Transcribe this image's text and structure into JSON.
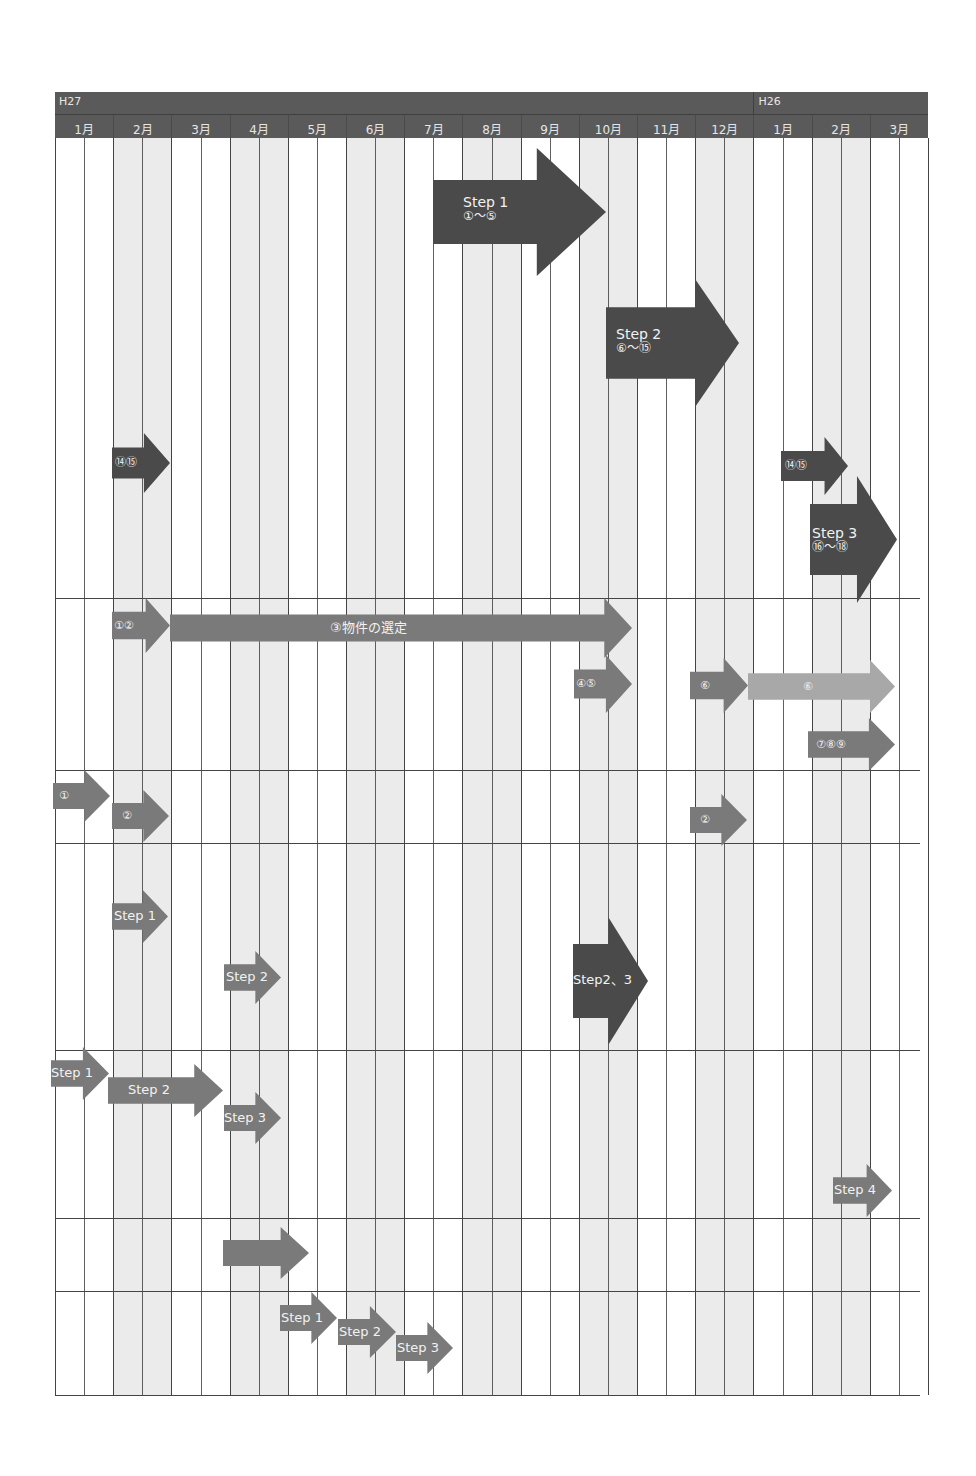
{
  "header": {
    "years": [
      {
        "label": "H27",
        "start_month_index": 0,
        "span": 12
      },
      {
        "label": "H26",
        "start_month_index": 12,
        "span": 3
      }
    ],
    "months": [
      "1月",
      "2月",
      "3月・4月",
      "4月",
      "5月",
      "6月",
      "7月",
      "8月",
      "9月",
      "10月",
      "11月",
      "12月",
      "1月",
      "2月",
      "3月"
    ],
    "month_labels_display": [
      "1月",
      "2月",
      "3月",
      "4月",
      "5月",
      "6月",
      "7月",
      "8月",
      "9月",
      "10月",
      "11月",
      "12月",
      "1月",
      "2月",
      "3月"
    ]
  },
  "colors": {
    "header_bg": "#5a5a5a",
    "header_text": "#e6e6e6",
    "shaded_column": "#ebebeb",
    "grid_line": "#444444",
    "arrow_dark": "#4a4a4a",
    "arrow_medium": "#7a7a7a",
    "arrow_light": "#a8a8a8",
    "arrow_text": "#f2f2f2"
  },
  "chart_data": {
    "type": "table",
    "title": "",
    "axis": {
      "x_categories": [
        "H27 1月",
        "2月",
        "3月",
        "4月",
        "5月",
        "6月",
        "7月",
        "8月",
        "9月",
        "10月",
        "11月",
        "12月",
        "H26 1月",
        "2月",
        "3月"
      ],
      "grid": true
    },
    "rows": [
      {
        "row": 1,
        "bars": [
          {
            "label": "Step 1",
            "sublabel": "①〜⑤",
            "start": 6.8,
            "end": 9.6,
            "shade": "dark",
            "size": "large"
          },
          {
            "label": "Step 2",
            "sublabel": "⑥〜⑮",
            "start": 9.6,
            "end": 11.9,
            "shade": "dark",
            "size": "large"
          },
          {
            "label": "⑭⑮",
            "start": 1.0,
            "end": 2.0,
            "shade": "dark"
          },
          {
            "label": "⑭⑮",
            "start": 12.5,
            "end": 13.5,
            "shade": "dark"
          },
          {
            "label": "Step 3",
            "sublabel": "⑯〜⑱",
            "start": 13.0,
            "end": 14.5,
            "shade": "dark",
            "size": "large"
          }
        ]
      },
      {
        "row": 2,
        "bars": [
          {
            "label": "①②",
            "start": 1.0,
            "end": 2.0,
            "shade": "medium"
          },
          {
            "label": "③物件の選定",
            "start": 2.0,
            "end": 10.0,
            "shade": "medium"
          },
          {
            "label": "④⑤",
            "start": 9.0,
            "end": 10.0,
            "shade": "medium"
          },
          {
            "label": "⑥",
            "start": 11.0,
            "end": 12.0,
            "shade": "medium"
          },
          {
            "label": "⑥",
            "start": 12.0,
            "end": 14.5,
            "shade": "light"
          },
          {
            "label": "⑦⑧⑨",
            "start": 13.0,
            "end": 14.5,
            "shade": "medium"
          }
        ]
      },
      {
        "row": 3,
        "bars": [
          {
            "label": "①",
            "start": 0.0,
            "end": 1.0,
            "shade": "medium"
          },
          {
            "label": "②",
            "start": 1.0,
            "end": 2.0,
            "shade": "medium"
          },
          {
            "label": "②",
            "start": 11.0,
            "end": 12.0,
            "shade": "medium"
          }
        ]
      },
      {
        "row": 4,
        "bars": [
          {
            "label": "Step 1",
            "start": 1.0,
            "end": 2.0,
            "shade": "medium"
          },
          {
            "label": "Step 2",
            "start": 3.0,
            "end": 4.0,
            "shade": "medium"
          },
          {
            "label": "Step2、3",
            "start": 9.0,
            "end": 10.3,
            "shade": "dark",
            "size": "large"
          }
        ]
      },
      {
        "row": 5,
        "bars": [
          {
            "label": "Step 1",
            "start": 0.0,
            "end": 1.0,
            "shade": "medium"
          },
          {
            "label": "Step 2",
            "start": 1.0,
            "end": 3.0,
            "shade": "medium"
          },
          {
            "label": "Step 3",
            "start": 3.0,
            "end": 4.0,
            "shade": "medium"
          },
          {
            "label": "Step 4",
            "start": 13.5,
            "end": 14.5,
            "shade": "medium"
          }
        ]
      },
      {
        "row": 6,
        "bars": [
          {
            "label": "",
            "start": 3.0,
            "end": 4.5,
            "shade": "medium"
          }
        ]
      },
      {
        "row": 7,
        "bars": [
          {
            "label": "Step 1",
            "start": 4.0,
            "end": 5.0,
            "shade": "medium"
          },
          {
            "label": "Step 2",
            "start": 5.0,
            "end": 6.0,
            "shade": "medium"
          },
          {
            "label": "Step 3",
            "start": 6.0,
            "end": 7.0,
            "shade": "medium"
          }
        ]
      }
    ]
  },
  "arrows": [
    {
      "id": "step1-main",
      "x": 433,
      "y": 148,
      "w": 173,
      "h": 128,
      "shaft": 0.5,
      "head": 0.4,
      "shade": "#4a4a4a",
      "label": "Step 1",
      "sub": "①〜⑤",
      "lx": 30,
      "ly": 47,
      "fs": 14
    },
    {
      "id": "step2-main",
      "x": 606,
      "y": 279,
      "w": 133,
      "h": 128,
      "shaft": 0.56,
      "head": 0.33,
      "shade": "#4a4a4a",
      "label": "Step 2",
      "sub": "⑥〜⑮",
      "lx": 10,
      "ly": 48,
      "fs": 14
    },
    {
      "id": "r1-1415-left",
      "x": 112,
      "y": 433,
      "w": 58,
      "h": 60,
      "shaft": 0.52,
      "head": 0.45,
      "shade": "#4a4a4a",
      "label": "⑭⑮",
      "sub": "",
      "lx": 3,
      "ly": 23,
      "fs": 11
    },
    {
      "id": "r1-1415-right",
      "x": 781,
      "y": 437,
      "w": 67,
      "h": 58,
      "shaft": 0.52,
      "head": 0.35,
      "shade": "#4a4a4a",
      "label": "⑭⑮",
      "sub": "",
      "lx": 4,
      "ly": 22,
      "fs": 11
    },
    {
      "id": "step3-main",
      "x": 810,
      "y": 476,
      "w": 87,
      "h": 127,
      "shaft": 0.56,
      "head": 0.46,
      "shade": "#4a4a4a",
      "label": "Step 3",
      "sub": "⑯〜⑱",
      "lx": 2,
      "ly": 50,
      "fs": 14
    },
    {
      "id": "r2-12",
      "x": 112,
      "y": 598,
      "w": 58,
      "h": 55,
      "shaft": 0.5,
      "head": 0.42,
      "shade": "#7a7a7a",
      "label": "①②",
      "sub": "",
      "lx": 2,
      "ly": 21,
      "fs": 11
    },
    {
      "id": "r2-3-bukken",
      "x": 170,
      "y": 598,
      "w": 462,
      "h": 60,
      "shaft": 0.45,
      "head": 0.06,
      "shade": "#7a7a7a",
      "label": "③物件の選定",
      "sub": "",
      "lx": 160,
      "ly": 23,
      "fs": 13
    },
    {
      "id": "r2-45",
      "x": 574,
      "y": 655,
      "w": 58,
      "h": 58,
      "shaft": 0.5,
      "head": 0.45,
      "shade": "#7a7a7a",
      "label": "④⑤",
      "sub": "",
      "lx": 2,
      "ly": 22,
      "fs": 11
    },
    {
      "id": "r2-6-dark",
      "x": 690,
      "y": 658,
      "w": 58,
      "h": 55,
      "shaft": 0.5,
      "head": 0.42,
      "shade": "#7a7a7a",
      "label": "⑥",
      "sub": "",
      "lx": 10,
      "ly": 21,
      "fs": 11
    },
    {
      "id": "r2-6-light",
      "x": 748,
      "y": 660,
      "w": 147,
      "h": 53,
      "shaft": 0.5,
      "head": 0.17,
      "shade": "#a8a8a8",
      "label": "⑥",
      "sub": "",
      "lx": 55,
      "ly": 20,
      "fs": 11
    },
    {
      "id": "r2-789",
      "x": 808,
      "y": 718,
      "w": 87,
      "h": 53,
      "shaft": 0.5,
      "head": 0.3,
      "shade": "#7a7a7a",
      "label": "⑦⑧⑨",
      "sub": "",
      "lx": 8,
      "ly": 20,
      "fs": 11
    },
    {
      "id": "r3-1",
      "x": 53,
      "y": 770,
      "w": 57,
      "h": 52,
      "shaft": 0.5,
      "head": 0.45,
      "shade": "#7a7a7a",
      "label": "①",
      "sub": "",
      "lx": 6,
      "ly": 19,
      "fs": 11
    },
    {
      "id": "r3-2-left",
      "x": 112,
      "y": 790,
      "w": 57,
      "h": 52,
      "shaft": 0.5,
      "head": 0.45,
      "shade": "#7a7a7a",
      "label": "②",
      "sub": "",
      "lx": 10,
      "ly": 19,
      "fs": 11
    },
    {
      "id": "r3-2-right",
      "x": 690,
      "y": 794,
      "w": 57,
      "h": 52,
      "shaft": 0.5,
      "head": 0.45,
      "shade": "#7a7a7a",
      "label": "②",
      "sub": "",
      "lx": 10,
      "ly": 19,
      "fs": 11
    },
    {
      "id": "r4-step1",
      "x": 112,
      "y": 890,
      "w": 56,
      "h": 53,
      "shaft": 0.5,
      "head": 0.45,
      "shade": "#7a7a7a",
      "label": "Step 1",
      "sub": "",
      "lx": 2,
      "ly": 19,
      "fs": 13
    },
    {
      "id": "r4-step2",
      "x": 224,
      "y": 951,
      "w": 57,
      "h": 53,
      "shaft": 0.5,
      "head": 0.45,
      "shade": "#7a7a7a",
      "label": "Step 2",
      "sub": "",
      "lx": 2,
      "ly": 19,
      "fs": 13
    },
    {
      "id": "r4-step23",
      "x": 573,
      "y": 917,
      "w": 75,
      "h": 128,
      "shaft": 0.58,
      "head": 0.53,
      "shade": "#4a4a4a",
      "label": "Step2、3",
      "sub": "",
      "lx": 0,
      "ly": 56,
      "fs": 13
    },
    {
      "id": "r5-step1",
      "x": 51,
      "y": 1047,
      "w": 58,
      "h": 53,
      "shaft": 0.5,
      "head": 0.45,
      "shade": "#7a7a7a",
      "label": "Step 1",
      "sub": "",
      "lx": 0,
      "ly": 19,
      "fs": 13
    },
    {
      "id": "r5-step2",
      "x": 108,
      "y": 1064,
      "w": 115,
      "h": 53,
      "shaft": 0.5,
      "head": 0.25,
      "shade": "#7a7a7a",
      "label": "Step 2",
      "sub": "",
      "lx": 20,
      "ly": 19,
      "fs": 13
    },
    {
      "id": "r5-step3",
      "x": 224,
      "y": 1092,
      "w": 57,
      "h": 52,
      "shaft": 0.5,
      "head": 0.45,
      "shade": "#7a7a7a",
      "label": "Step 3",
      "sub": "",
      "lx": 0,
      "ly": 19,
      "fs": 13
    },
    {
      "id": "r5-step4",
      "x": 833,
      "y": 1164,
      "w": 59,
      "h": 53,
      "shaft": 0.5,
      "head": 0.43,
      "shade": "#7a7a7a",
      "label": "Step 4",
      "sub": "",
      "lx": 1,
      "ly": 19,
      "fs": 13
    },
    {
      "id": "r6-unlabeled",
      "x": 223,
      "y": 1227,
      "w": 86,
      "h": 52,
      "shaft": 0.5,
      "head": 0.33,
      "shade": "#7a7a7a",
      "label": "",
      "sub": "",
      "lx": 0,
      "ly": 0,
      "fs": 11
    },
    {
      "id": "r7-step1",
      "x": 280,
      "y": 1292,
      "w": 57,
      "h": 52,
      "shaft": 0.5,
      "head": 0.45,
      "shade": "#7a7a7a",
      "label": "Step 1",
      "sub": "",
      "lx": 1,
      "ly": 19,
      "fs": 13
    },
    {
      "id": "r7-step2",
      "x": 338,
      "y": 1306,
      "w": 58,
      "h": 52,
      "shaft": 0.5,
      "head": 0.45,
      "shade": "#7a7a7a",
      "label": "Step 2",
      "sub": "",
      "lx": 1,
      "ly": 19,
      "fs": 13
    },
    {
      "id": "r7-step3",
      "x": 396,
      "y": 1322,
      "w": 57,
      "h": 52,
      "shaft": 0.5,
      "head": 0.45,
      "shade": "#7a7a7a",
      "label": "Step 3",
      "sub": "",
      "lx": 1,
      "ly": 19,
      "fs": 13
    }
  ]
}
